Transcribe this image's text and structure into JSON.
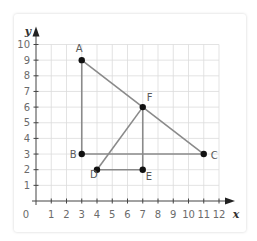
{
  "diagram": {
    "axes": {
      "x_label": "x",
      "y_label": "y",
      "origin_label": "0",
      "x_ticks": [
        "1",
        "2",
        "3",
        "4",
        "5",
        "6",
        "7",
        "8",
        "9",
        "10",
        "11",
        "12"
      ],
      "y_ticks": [
        "1",
        "2",
        "3",
        "4",
        "5",
        "6",
        "7",
        "8",
        "9",
        "10"
      ]
    },
    "points": [
      {
        "label": "A",
        "x": 3,
        "y": 9
      },
      {
        "label": "B",
        "x": 3,
        "y": 3
      },
      {
        "label": "C",
        "x": 11,
        "y": 3
      },
      {
        "label": "D",
        "x": 4,
        "y": 2
      },
      {
        "label": "E",
        "x": 7,
        "y": 2
      },
      {
        "label": "F",
        "x": 7,
        "y": 6
      }
    ],
    "segments": [
      [
        "A",
        "B"
      ],
      [
        "B",
        "C"
      ],
      [
        "A",
        "C"
      ],
      [
        "D",
        "F"
      ],
      [
        "F",
        "E"
      ],
      [
        "D",
        "E"
      ]
    ],
    "colors": {
      "grid": "#dcdcdc",
      "axis": "#444444",
      "segment": "#8a8a8a",
      "point": "#111111"
    }
  }
}
